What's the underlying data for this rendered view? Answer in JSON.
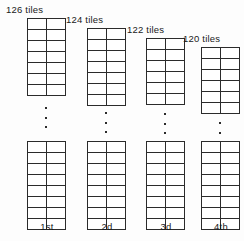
{
  "figure": {
    "background_color": "#fdfdfd",
    "line_color": "#2b2b2b",
    "text_color": "#1a1a1a"
  },
  "columns": [
    {
      "count_label": "126 tiles",
      "ordinal_label": "1st",
      "tiles": 126,
      "columns_wide": 2,
      "top_block_rows": 7,
      "bottom_block_rows": 8,
      "ellipsis_dots": 3,
      "left": 27,
      "label_left": 6,
      "label_top": 4,
      "top_block_top": 18,
      "ellipsis_top": 107,
      "bottom_block_top": 141,
      "ordinal_top": 221
    },
    {
      "count_label": "124 tiles",
      "ordinal_label": "2d",
      "tiles": 124,
      "columns_wide": 2,
      "top_block_rows": 7,
      "bottom_block_rows": 8,
      "ellipsis_dots": 3,
      "left": 87,
      "label_left": 66,
      "label_top": 14,
      "top_block_top": 28,
      "ellipsis_top": 112,
      "bottom_block_top": 141,
      "ordinal_top": 221
    },
    {
      "count_label": "122 tiles",
      "ordinal_label": "3d",
      "tiles": 122,
      "columns_wide": 2,
      "top_block_rows": 6,
      "bottom_block_rows": 8,
      "ellipsis_dots": 3,
      "left": 146,
      "label_left": 127,
      "label_top": 24,
      "top_block_top": 38,
      "ellipsis_top": 113,
      "bottom_block_top": 141,
      "ordinal_top": 221
    },
    {
      "count_label": "120 tiles",
      "ordinal_label": "4th",
      "tiles": 120,
      "columns_wide": 2,
      "top_block_rows": 6,
      "bottom_block_rows": 8,
      "ellipsis_dots": 3,
      "left": 201,
      "label_left": 183,
      "label_top": 33,
      "top_block_top": 47,
      "ellipsis_top": 122,
      "bottom_block_top": 141,
      "ordinal_top": 221
    }
  ]
}
